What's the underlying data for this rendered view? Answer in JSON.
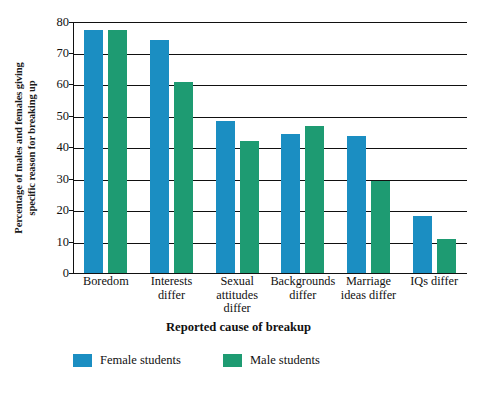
{
  "chart_data": {
    "type": "bar",
    "title": "",
    "subtitle": "",
    "xlabel": "Reported cause of breakup",
    "ylabel": "Percentage of males and females giving specific reason for breaking up",
    "ylabel_lines": [
      "Percentage of males and females giving",
      "specific reason for breaking up"
    ],
    "categories": [
      "Boredom",
      "Interests differ",
      "Sexual attitudes differ",
      "Backgrounds differ",
      "Marriage ideas differ",
      "IQs differ"
    ],
    "category_lines": [
      [
        "Boredom"
      ],
      [
        "Interests",
        "differ"
      ],
      [
        "Sexual",
        "attitudes",
        "differ"
      ],
      [
        "Backgrounds",
        "differ"
      ],
      [
        "Marriage",
        "ideas differ"
      ],
      [
        "IQs differ"
      ]
    ],
    "series": [
      {
        "name": "Female students",
        "color": "#1b8ec2",
        "values": [
          77.3,
          74.2,
          48.5,
          44.2,
          43.7,
          18.3
        ]
      },
      {
        "name": "Male students",
        "color": "#1e9b72",
        "values": [
          77.3,
          60.8,
          42.0,
          46.7,
          29.3,
          11.0
        ]
      }
    ],
    "ylim": [
      0,
      80
    ],
    "ytick_values": [
      0,
      10,
      20,
      30,
      40,
      50,
      60,
      70,
      80
    ],
    "ytick_labels": [
      "0",
      "10",
      "20",
      "30",
      "40",
      "50",
      "60",
      "70",
      "80"
    ],
    "grid": "horizontal",
    "legend_position": "bottom-left",
    "legend": [
      {
        "label": "Female students",
        "color": "#1b8ec2"
      },
      {
        "label": "Male students",
        "color": "#1e9b72"
      }
    ]
  },
  "colors": {
    "female": "#1b8ec2",
    "male": "#1e9b72",
    "axis": "#111111",
    "background": "#ffffff"
  }
}
